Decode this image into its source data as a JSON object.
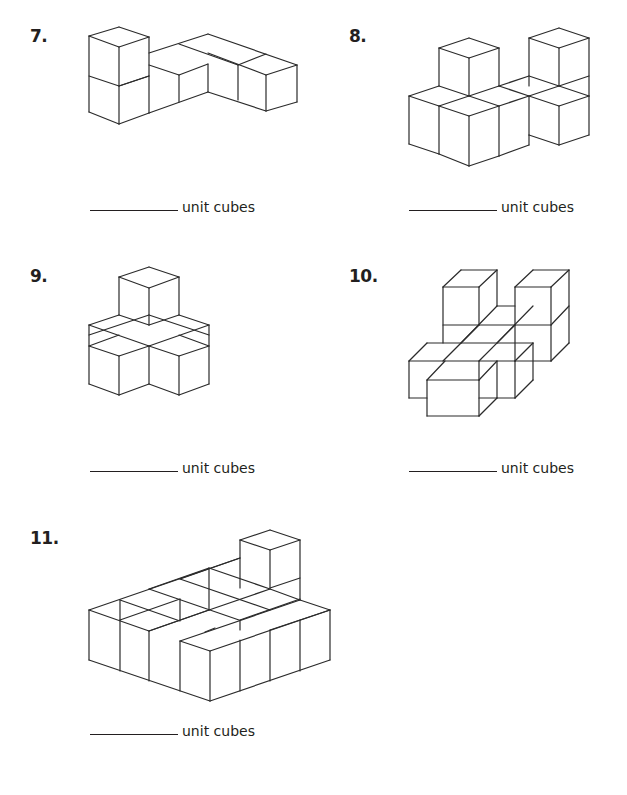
{
  "worksheet": {
    "answer_label": "unit cubes",
    "problems": [
      {
        "number": "7.",
        "answer_value": "",
        "label": "unit cubes",
        "figure_lines": [
          [
            89,
            36,
            119,
            27
          ],
          [
            119,
            27,
            149,
            37
          ],
          [
            89,
            36,
            119,
            47
          ],
          [
            119,
            47,
            149,
            37
          ],
          [
            89,
            36,
            89,
            112
          ],
          [
            119,
            47,
            119,
            124
          ],
          [
            149,
            37,
            149,
            113
          ],
          [
            89,
            76,
            119,
            86
          ],
          [
            119,
            86,
            149,
            76
          ],
          [
            89,
            112,
            119,
            124
          ],
          [
            119,
            124,
            149,
            113
          ],
          [
            149,
            53,
            208,
            34
          ],
          [
            208,
            34,
            297,
            65
          ],
          [
            149,
            65,
            179,
            75
          ],
          [
            179,
            75,
            208,
            64
          ],
          [
            179,
            44,
            238,
            65
          ],
          [
            208,
            53,
            266,
            75
          ],
          [
            238,
            65,
            266,
            54
          ],
          [
            266,
            75,
            297,
            65
          ],
          [
            179,
            75,
            179,
            102
          ],
          [
            208,
            64,
            208,
            92
          ],
          [
            238,
            65,
            238,
            100
          ],
          [
            266,
            75,
            266,
            111
          ],
          [
            297,
            65,
            297,
            102
          ],
          [
            149,
            113,
            208,
            92
          ],
          [
            208,
            92,
            266,
            111
          ],
          [
            266,
            111,
            297,
            102
          ],
          [
            119,
            86,
            149,
            76
          ]
        ]
      },
      {
        "number": "8.",
        "answer_value": "",
        "label": "unit cubes",
        "figure_lines": [
          [
            439,
            48,
            469,
            38
          ],
          [
            469,
            38,
            499,
            48
          ],
          [
            439,
            48,
            469,
            58
          ],
          [
            469,
            58,
            499,
            48
          ],
          [
            439,
            48,
            439,
            86
          ],
          [
            469,
            58,
            469,
            96
          ],
          [
            499,
            48,
            499,
            86
          ],
          [
            529,
            38,
            559,
            28
          ],
          [
            559,
            28,
            589,
            38
          ],
          [
            529,
            38,
            559,
            48
          ],
          [
            559,
            48,
            589,
            38
          ],
          [
            529,
            38,
            529,
            86
          ],
          [
            559,
            48,
            559,
            86
          ],
          [
            589,
            38,
            589,
            96
          ],
          [
            559,
            86,
            589,
            76
          ],
          [
            409,
            96,
            439,
            86
          ],
          [
            439,
            86,
            469,
            96
          ],
          [
            409,
            96,
            439,
            106
          ],
          [
            469,
            96,
            499,
            86
          ],
          [
            499,
            86,
            529,
            96
          ],
          [
            439,
            106,
            469,
            96
          ],
          [
            469,
            96,
            499,
            106
          ],
          [
            499,
            86,
            529,
            76
          ],
          [
            529,
            76,
            559,
            86
          ],
          [
            559,
            86,
            589,
            96
          ],
          [
            529,
            96,
            559,
            86
          ],
          [
            529,
            96,
            559,
            106
          ],
          [
            559,
            106,
            589,
            96
          ],
          [
            439,
            106,
            469,
            116
          ],
          [
            469,
            116,
            499,
            106
          ],
          [
            499,
            106,
            529,
            96
          ],
          [
            409,
            96,
            409,
            144
          ],
          [
            439,
            106,
            439,
            154
          ],
          [
            469,
            116,
            469,
            166
          ],
          [
            499,
            106,
            499,
            156
          ],
          [
            529,
            96,
            529,
            135
          ],
          [
            559,
            106,
            559,
            145
          ],
          [
            589,
            96,
            589,
            135
          ],
          [
            409,
            144,
            439,
            154
          ],
          [
            439,
            154,
            469,
            166
          ],
          [
            469,
            166,
            499,
            156
          ],
          [
            499,
            156,
            529,
            145
          ],
          [
            529,
            135,
            559,
            145
          ],
          [
            559,
            145,
            589,
            135
          ],
          [
            529,
            135,
            529,
            145
          ]
        ]
      },
      {
        "number": "9.",
        "answer_value": "",
        "label": "unit cubes",
        "figure_lines": [
          [
            119,
            277,
            149,
            267
          ],
          [
            149,
            267,
            179,
            277
          ],
          [
            119,
            277,
            149,
            288
          ],
          [
            149,
            288,
            179,
            277
          ],
          [
            119,
            277,
            119,
            315
          ],
          [
            149,
            288,
            149,
            325
          ],
          [
            179,
            277,
            179,
            315
          ],
          [
            89,
            325,
            119,
            315
          ],
          [
            119,
            315,
            149,
            325
          ],
          [
            149,
            325,
            179,
            315
          ],
          [
            179,
            315,
            209,
            325
          ],
          [
            89,
            325,
            149,
            346
          ],
          [
            149,
            346,
            209,
            325
          ],
          [
            89,
            335,
            149,
            315
          ],
          [
            149,
            315,
            209,
            335
          ],
          [
            89,
            346,
            119,
            335
          ],
          [
            179,
            335,
            209,
            346
          ],
          [
            89,
            346,
            119,
            356
          ],
          [
            119,
            356,
            149,
            346
          ],
          [
            149,
            346,
            179,
            356
          ],
          [
            179,
            356,
            209,
            346
          ],
          [
            89,
            325,
            89,
            384
          ],
          [
            209,
            325,
            209,
            384
          ],
          [
            119,
            356,
            119,
            395
          ],
          [
            149,
            346,
            149,
            384
          ],
          [
            179,
            356,
            179,
            395
          ],
          [
            89,
            384,
            119,
            395
          ],
          [
            119,
            395,
            149,
            384
          ],
          [
            149,
            384,
            179,
            395
          ],
          [
            179,
            395,
            209,
            384
          ]
        ]
      },
      {
        "number": "10.",
        "answer_value": "",
        "label": "unit cubes",
        "figure_lines": [
          [
            443,
            287,
            461,
            270
          ],
          [
            461,
            270,
            497,
            270
          ],
          [
            443,
            287,
            479,
            287
          ],
          [
            479,
            287,
            497,
            270
          ],
          [
            443,
            287,
            443,
            343
          ],
          [
            479,
            287,
            479,
            325
          ],
          [
            497,
            270,
            497,
            306
          ],
          [
            515,
            287,
            533,
            270
          ],
          [
            533,
            270,
            569,
            270
          ],
          [
            515,
            287,
            551,
            287
          ],
          [
            551,
            287,
            569,
            270
          ],
          [
            515,
            287,
            515,
            361
          ],
          [
            551,
            287,
            551,
            361
          ],
          [
            569,
            270,
            569,
            343
          ],
          [
            497,
            306,
            515,
            306
          ],
          [
            443,
            325,
            551,
            325
          ],
          [
            551,
            325,
            569,
            306
          ],
          [
            479,
            325,
            443,
            361
          ],
          [
            497,
            306,
            461,
            343
          ],
          [
            515,
            325,
            479,
            361
          ],
          [
            533,
            306,
            497,
            343
          ],
          [
            551,
            361,
            569,
            343
          ],
          [
            515,
            361,
            551,
            361
          ],
          [
            409,
            361,
            427,
            343
          ],
          [
            427,
            343,
            533,
            343
          ],
          [
            409,
            361,
            515,
            361
          ],
          [
            515,
            361,
            533,
            343
          ],
          [
            409,
            361,
            409,
            398
          ],
          [
            515,
            361,
            515,
            398
          ],
          [
            533,
            343,
            533,
            380
          ],
          [
            409,
            398,
            427,
            398
          ],
          [
            479,
            398,
            515,
            398
          ],
          [
            515,
            398,
            533,
            380
          ],
          [
            427,
            380,
            445,
            361
          ],
          [
            427,
            380,
            479,
            380
          ],
          [
            479,
            380,
            497,
            361
          ],
          [
            427,
            380,
            427,
            416
          ],
          [
            479,
            380,
            479,
            416
          ],
          [
            497,
            361,
            497,
            398
          ],
          [
            427,
            416,
            479,
            416
          ],
          [
            479,
            416,
            497,
            398
          ],
          [
            479,
            361,
            479,
            380
          ]
        ]
      },
      {
        "number": "11.",
        "answer_value": "",
        "label": "unit cubes",
        "figure_lines": [
          [
            240,
            540,
            270,
            530
          ],
          [
            270,
            530,
            300,
            540
          ],
          [
            240,
            540,
            270,
            550
          ],
          [
            270,
            550,
            300,
            540
          ],
          [
            240,
            540,
            240,
            588
          ],
          [
            270,
            550,
            270,
            588
          ],
          [
            300,
            540,
            300,
            600
          ],
          [
            270,
            588,
            300,
            578
          ],
          [
            89,
            610,
            240,
            558
          ],
          [
            89,
            610,
            149,
            631
          ],
          [
            149,
            631,
            209,
            610
          ],
          [
            120,
            600,
            180,
            621
          ],
          [
            149,
            589,
            239,
            620
          ],
          [
            180,
            579,
            270,
            610
          ],
          [
            209,
            568,
            270,
            589
          ],
          [
            120,
            620,
            180,
            599
          ],
          [
            149,
            631,
            209,
            610
          ],
          [
            180,
            641,
            300,
            600
          ],
          [
            209,
            610,
            270,
            589
          ],
          [
            120,
            600,
            120,
            620
          ],
          [
            149,
            589,
            209,
            568
          ],
          [
            180,
            579,
            240,
            558
          ],
          [
            270,
            589,
            300,
            600
          ],
          [
            300,
            600,
            330,
            610
          ],
          [
            240,
            620,
            300,
            599
          ],
          [
            270,
            630,
            330,
            610
          ],
          [
            180,
            641,
            210,
            651
          ],
          [
            210,
            651,
            330,
            610
          ],
          [
            180,
            599,
            180,
            620
          ],
          [
            209,
            568,
            209,
            610
          ],
          [
            240,
            620,
            240,
            630
          ],
          [
            89,
            610,
            89,
            660
          ],
          [
            120,
            620,
            120,
            671
          ],
          [
            149,
            631,
            149,
            681
          ],
          [
            180,
            641,
            180,
            691
          ],
          [
            210,
            651,
            210,
            701
          ],
          [
            240,
            640,
            240,
            691
          ],
          [
            270,
            630,
            270,
            681
          ],
          [
            300,
            620,
            300,
            671
          ],
          [
            330,
            610,
            330,
            660
          ],
          [
            89,
            660,
            210,
            701
          ],
          [
            210,
            701,
            330,
            660
          ],
          [
            205,
            632,
            215,
            628
          ]
        ]
      }
    ]
  }
}
